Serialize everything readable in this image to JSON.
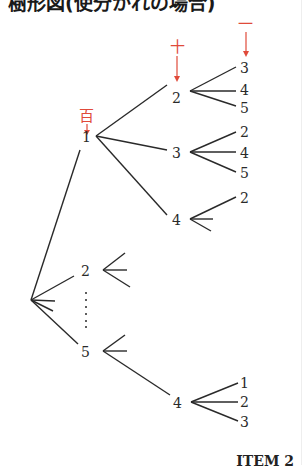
{
  "title": "樹形図(使分かれの場合)",
  "footer_label": "ITEM 2",
  "colors": {
    "line": "#2a2a2a",
    "accent": "#e04a3a"
  },
  "place_labels": {
    "hundreds": "百",
    "tens": "十",
    "ones": "一"
  },
  "tree": {
    "root_children": [
      {
        "label": "1",
        "children": [
          {
            "label": "2",
            "children": [
              "3",
              "4",
              "5"
            ]
          },
          {
            "label": "3",
            "children": [
              "2",
              "4",
              "5"
            ]
          },
          {
            "label": "4",
            "children": [
              "2"
            ]
          }
        ]
      },
      {
        "label": "2",
        "children": []
      },
      {
        "label": "……",
        "children": []
      },
      {
        "label": "5",
        "children": [
          {
            "label": "4",
            "children": [
              "1",
              "2",
              "3"
            ]
          }
        ]
      }
    ]
  },
  "labels": {
    "n1": "1",
    "n1_2": "2",
    "n1_2_a": "3",
    "n1_2_b": "4",
    "n1_2_c": "5",
    "n1_3": "3",
    "n1_3_a": "2",
    "n1_3_b": "4",
    "n1_3_c": "5",
    "n1_4": "4",
    "n1_4_a": "2",
    "n2": "2",
    "n5": "5",
    "n5_4": "4",
    "n5_4_a": "1",
    "n5_4_b": "2",
    "n5_4_c": "3"
  }
}
